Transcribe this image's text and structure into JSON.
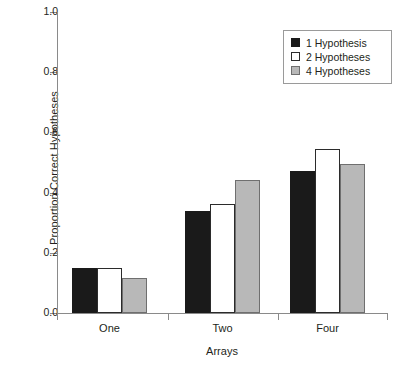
{
  "chart_data": {
    "type": "bar",
    "title": "",
    "xlabel": "Arrays",
    "ylabel": "Proportion Correct Hypotheses",
    "categories": [
      "One",
      "Two",
      "Four"
    ],
    "series": [
      {
        "name": "1 Hypothesis",
        "color": "#1a1a1a",
        "values": [
          0.15,
          0.34,
          0.473
        ]
      },
      {
        "name": "2 Hypotheses",
        "color": "#ffffff",
        "values": [
          0.15,
          0.362,
          0.545
        ]
      },
      {
        "name": "4 Hypotheses",
        "color": "#b8b8b8",
        "values": [
          0.115,
          0.442,
          0.495
        ]
      }
    ],
    "ylim": [
      0.0,
      1.0
    ],
    "ytick_labels": [
      "0.0",
      "0.2",
      "0.4",
      "0.6",
      "0.8",
      "1.0"
    ],
    "ytick_values": [
      0.0,
      0.2,
      0.4,
      0.6,
      0.8,
      1.0
    ],
    "grid": false,
    "legend_position": "top-right"
  }
}
